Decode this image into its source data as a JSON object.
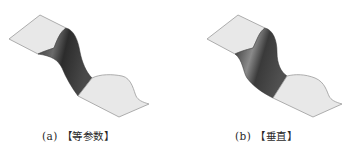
{
  "figure": {
    "panels": [
      {
        "id": "a",
        "caption": "(a) 【等参数】",
        "colors": {
          "flat": "#e6e6e6",
          "edge": "#9a9a9a",
          "band_dark": "#2e2e2e",
          "band_mid": "#5a5a5a",
          "band_light": "#7c7c7c"
        }
      },
      {
        "id": "b",
        "caption": "(b) 【垂直】",
        "colors": {
          "flat": "#e6e6e6",
          "edge": "#9a9a9a",
          "band_dark": "#2a2a2a",
          "band_mid": "#555555",
          "band_light": "#8a8a8a"
        }
      }
    ]
  }
}
